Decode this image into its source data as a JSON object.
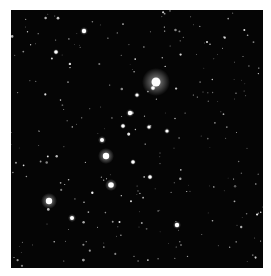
{
  "image": {
    "subject": "star cluster field",
    "background_color": "#050505",
    "frame_color": "#ffffff",
    "bright_stars": [
      {
        "x": 156,
        "y": 82,
        "r": 4.5,
        "halo": 14
      },
      {
        "x": 106,
        "y": 156,
        "r": 3.2,
        "halo": 8
      },
      {
        "x": 49,
        "y": 201,
        "r": 3.2,
        "halo": 8
      },
      {
        "x": 111,
        "y": 185,
        "r": 2.8,
        "halo": 6
      },
      {
        "x": 84,
        "y": 31,
        "r": 2.2,
        "halo": 4
      },
      {
        "x": 56,
        "y": 52,
        "r": 1.8,
        "halo": 3
      },
      {
        "x": 130,
        "y": 113,
        "r": 2.2,
        "halo": 4
      },
      {
        "x": 102,
        "y": 140,
        "r": 2,
        "halo": 4
      },
      {
        "x": 153,
        "y": 88,
        "r": 1.8,
        "halo": 3
      },
      {
        "x": 177,
        "y": 225,
        "r": 2.2,
        "halo": 4
      },
      {
        "x": 72,
        "y": 218,
        "r": 2,
        "halo": 4
      },
      {
        "x": 150,
        "y": 177,
        "r": 1.8,
        "halo": 3
      },
      {
        "x": 123,
        "y": 126,
        "r": 1.8,
        "halo": 3
      },
      {
        "x": 133,
        "y": 162,
        "r": 1.8,
        "halo": 3
      },
      {
        "x": 149,
        "y": 127,
        "r": 1.6,
        "halo": 3
      },
      {
        "x": 167,
        "y": 131,
        "r": 1.6,
        "halo": 3
      },
      {
        "x": 137,
        "y": 95,
        "r": 1.6,
        "halo": 3
      }
    ]
  }
}
